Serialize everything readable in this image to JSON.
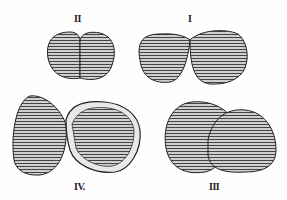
{
  "figure": {
    "labels": {
      "fig2": "II",
      "fig1": "I",
      "fig4": "IV.",
      "fig3": "III"
    },
    "colors": {
      "ink": "#2a2a2a",
      "paper": "#fefefe",
      "mid": "#8a8a8a"
    }
  }
}
